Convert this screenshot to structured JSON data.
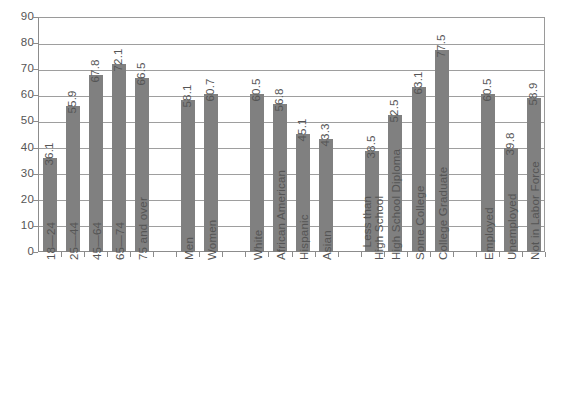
{
  "chart_data": {
    "type": "bar",
    "title": "",
    "subtitle": "",
    "xlabel": "",
    "ylabel": "",
    "ylim": [
      0,
      90
    ],
    "ytick_step": 10,
    "yticks": [
      0,
      10,
      20,
      30,
      40,
      50,
      60,
      70,
      80,
      90
    ],
    "grid": true,
    "legend": "none",
    "orientation": "vertical",
    "bar_color": "#808080",
    "value_label_rotation": -90,
    "category_label_rotation": -90,
    "groups": [
      {
        "name": "Age",
        "categories": [
          "18—24",
          "25—44",
          "45—64",
          "65—74",
          "75 and over"
        ],
        "values": [
          36.1,
          55.9,
          67.8,
          72.1,
          66.5
        ]
      },
      {
        "name": "Gender",
        "categories": [
          "Men",
          "Women"
        ],
        "values": [
          58.1,
          60.7
        ]
      },
      {
        "name": "Race and Ethnicity",
        "categories": [
          "White",
          "African American",
          "Hispanic",
          "Asian"
        ],
        "values": [
          60.5,
          56.8,
          45.1,
          43.3
        ]
      },
      {
        "name": "Education",
        "categories": [
          "Less than High School",
          "High School Diploma",
          "Some College",
          "College Graduate"
        ],
        "values": [
          38.5,
          52.5,
          63.1,
          77.5
        ]
      },
      {
        "name": "Employment Status",
        "categories": [
          "Employed",
          "Unemployed",
          "Not in Labor Force"
        ],
        "values": [
          60.5,
          39.8,
          58.9
        ]
      }
    ],
    "categories": [
      "18—24",
      "25—44",
      "45—64",
      "65—74",
      "75 and over",
      "Men",
      "Women",
      "White",
      "African American",
      "Hispanic",
      "Asian",
      "Less than High School",
      "High School Diploma",
      "Some College",
      "College Graduate",
      "Employed",
      "Unemployed",
      "Not in Labor Force"
    ],
    "values": [
      36.1,
      55.9,
      67.8,
      72.1,
      66.5,
      58.1,
      60.7,
      60.5,
      56.8,
      45.1,
      43.3,
      38.5,
      52.5,
      63.1,
      77.5,
      60.5,
      39.8,
      58.9
    ],
    "category_labels_multiline": {
      "Less than High School": [
        "Less than",
        "High School"
      ]
    }
  }
}
